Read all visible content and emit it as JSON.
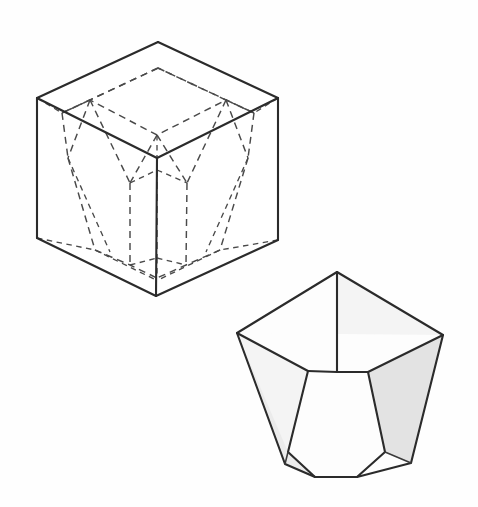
{
  "figure": {
    "background_color": "#fefefe",
    "line_color": "#2b2b2b",
    "hidden_line_color": "#4a4a4a",
    "shade_light": "#f4f4f4",
    "shade_medium": "#ebebeb",
    "shade_dark": "#e3e3e3",
    "canvas": {
      "width": 478,
      "height": 507
    }
  },
  "cube": {
    "name": "reference-cube",
    "description": "Isometric cube drawn with solid visible edges enclosing a dashed inscribed trapezohedron",
    "vertices": {
      "top_back": [
        158,
        42
      ],
      "top_left": [
        37,
        98
      ],
      "top_right": [
        278,
        98
      ],
      "top_front": [
        157,
        158
      ],
      "bottom_left": [
        37,
        238
      ],
      "bottom_right": [
        278,
        240
      ],
      "bottom_front": [
        156,
        296
      ]
    },
    "visible_edges": [
      [
        [
          37,
          98
        ],
        [
          158,
          42
        ]
      ],
      [
        [
          158,
          42
        ],
        [
          278,
          98
        ]
      ],
      [
        [
          37,
          98
        ],
        [
          157,
          158
        ]
      ],
      [
        [
          157,
          158
        ],
        [
          278,
          98
        ]
      ],
      [
        [
          37,
          98
        ],
        [
          37,
          238
        ]
      ],
      [
        [
          278,
          98
        ],
        [
          278,
          240
        ]
      ],
      [
        [
          157,
          158
        ],
        [
          156,
          296
        ]
      ],
      [
        [
          37,
          238
        ],
        [
          156,
          296
        ]
      ],
      [
        [
          156,
          296
        ],
        [
          278,
          240
        ]
      ]
    ]
  },
  "inscribed_polyhedron": {
    "name": "dashed-trapezohedron",
    "line_style": "dashed",
    "description": "Deltoid trapezohedron with small rhombic top face, three visible upper deltoid faces and tapering lower faces, all drawn as hidden dashed lines inside the cube",
    "top_face": [
      [
        158,
        68
      ],
      [
        90,
        100
      ],
      [
        157,
        135
      ],
      [
        226,
        100
      ]
    ],
    "shoulder_ring": [
      [
        62,
        113
      ],
      [
        158,
        68
      ],
      [
        254,
        113
      ],
      [
        226,
        100
      ],
      [
        157,
        135
      ],
      [
        90,
        100
      ]
    ],
    "waist_ring": [
      [
        68,
        158
      ],
      [
        130,
        183
      ],
      [
        157,
        170
      ],
      [
        187,
        183
      ],
      [
        248,
        158
      ]
    ],
    "base_ring": [
      [
        95,
        250
      ],
      [
        130,
        265
      ],
      [
        157,
        258
      ],
      [
        186,
        265
      ],
      [
        220,
        250
      ],
      [
        157,
        278
      ]
    ]
  },
  "solid_polyhedron": {
    "name": "shaded-trapezohedron",
    "description": "Same crystal form drawn solid with shaded faces, positioned lower right",
    "apex": [
      337,
      272
    ],
    "left_top_corner": [
      237,
      333
    ],
    "right_top_corner": [
      443,
      335
    ],
    "center_junction": [
      337,
      372
    ],
    "bottom_center_left": [
      315,
      477
    ],
    "bottom_center_right": [
      357,
      477
    ],
    "bottom_left": [
      285,
      464
    ],
    "bottom_right": [
      411,
      463
    ],
    "faces": [
      {
        "name": "top-rear-left-face",
        "shade": "#fdfdfd"
      },
      {
        "name": "top-rear-right-face",
        "shade": "#f1f1f1"
      },
      {
        "name": "top-front-face",
        "shade": "#fbfbfb"
      },
      {
        "name": "lower-left-face",
        "shade": "#f6f6f6"
      },
      {
        "name": "lower-front-left-face",
        "shade": "#f0f0f0"
      },
      {
        "name": "lower-front-center-face",
        "shade": "#f8f8f8"
      },
      {
        "name": "lower-front-right-face",
        "shade": "#ececec"
      },
      {
        "name": "lower-right-face",
        "shade": "#e4e4e4"
      }
    ]
  }
}
